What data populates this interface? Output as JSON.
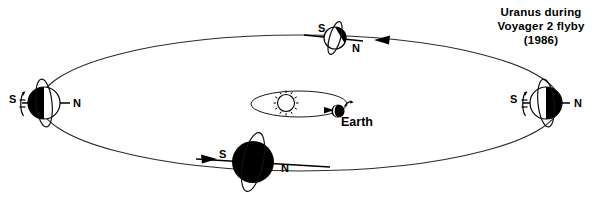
{
  "diagram": {
    "title_lines": [
      "Uranus during",
      "Voyager 2 flyby",
      "(1986)"
    ],
    "center_body_label": "Earth",
    "sun_icon": "sun-icon",
    "orbit_direction_icon": "orbit-direction-arrow-icon",
    "colors": {
      "background": "#ffffff",
      "ink": "#000000",
      "orbit_line": "#2b2b2b",
      "planet_dark": "#000000",
      "planet_light": "#ffffff"
    },
    "positions": [
      {
        "id": "uranus-left",
        "name": "uranus-position-left",
        "south_label": "S",
        "north_label": "N",
        "south_side": "left",
        "north_side": "right",
        "shading": "dark-left",
        "ring_orientation": "vertical",
        "rotation_arrow": "rotation-arrow-icon"
      },
      {
        "id": "uranus-top",
        "name": "uranus-position-top",
        "south_label": "S",
        "north_label": "N",
        "south_side": "left",
        "north_side": "right",
        "shading": "dark-upper-right",
        "ring_orientation": "tilted",
        "rotation_arrow": "none"
      },
      {
        "id": "uranus-right",
        "name": "uranus-position-right",
        "south_label": "S",
        "north_label": "N",
        "south_side": "left",
        "north_side": "right",
        "shading": "dark-right",
        "ring_orientation": "vertical",
        "rotation_arrow": "rotation-arrow-icon"
      },
      {
        "id": "uranus-bottom",
        "name": "uranus-position-bottom",
        "south_label": "S",
        "north_label": "N",
        "south_side": "left",
        "north_side": "right",
        "shading": "dark-full",
        "ring_orientation": "tilted",
        "rotation_arrow": "none"
      }
    ]
  }
}
